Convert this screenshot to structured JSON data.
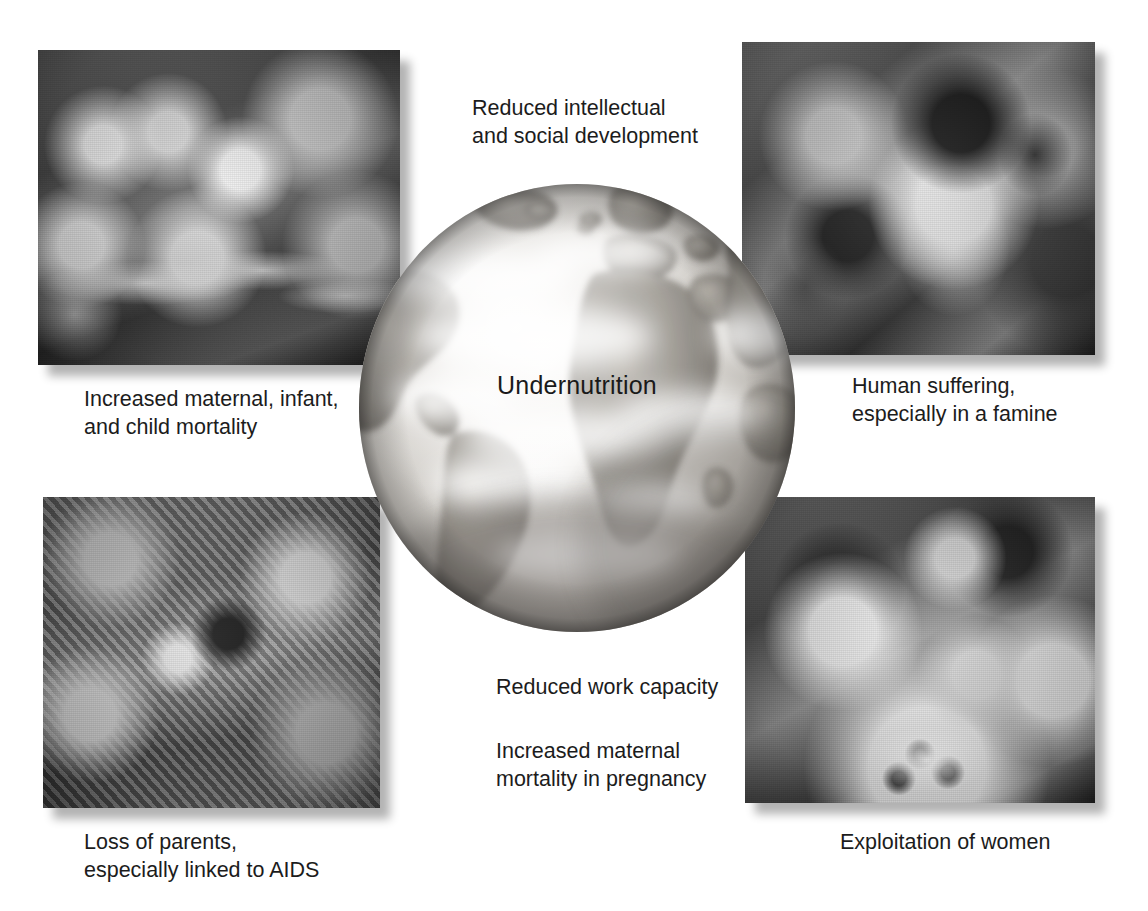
{
  "figure": {
    "center_label": "Undernutrition",
    "captions": {
      "reduced_development": "Reduced intellectual\nand social development",
      "mortality": "Increased maternal, infant,\nand child mortality",
      "human_suffering": "Human suffering,\nespecially in a famine",
      "work_capacity": "Reduced work capacity",
      "maternal_pregnancy": "Increased maternal\nmortality in pregnancy",
      "loss_of_parents": "Loss of parents,\nespecially linked to AIDS",
      "exploitation": "Exploitation of women"
    },
    "photos": [
      {
        "name": "crowd-reaching-for-food",
        "position": "top-left"
      },
      {
        "name": "famine-children",
        "position": "top-right"
      },
      {
        "name": "children-in-rubbish-dump",
        "position": "bottom-left"
      },
      {
        "name": "weeping-women",
        "position": "bottom-right"
      }
    ],
    "colors": {
      "background": "#ffffff",
      "text": "#1c1c1c",
      "globe_ocean_light": "#f4f2ef",
      "globe_ocean_mid": "#b9b6b1",
      "globe_land": "#8d8a85",
      "globe_land_dark": "#6d6a66"
    }
  }
}
